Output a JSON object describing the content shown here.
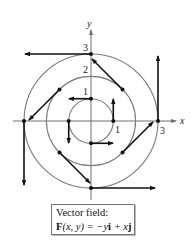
{
  "diagram": {
    "type": "vector_field_plot",
    "axes": {
      "x_label": "x",
      "y_label": "y"
    },
    "tick_labels": [
      {
        "text": "1",
        "position": "x=1 below axis"
      },
      {
        "text": "3",
        "position": "x=3 below axis"
      },
      {
        "text": "1",
        "position": "y=1 left of axis"
      },
      {
        "text": "2",
        "position": "y=2 left of axis"
      },
      {
        "text": "3",
        "position": "y=3 left of axis"
      }
    ],
    "circles": [
      {
        "radius": 1
      },
      {
        "radius": 2
      },
      {
        "radius": 3
      }
    ],
    "vectors": [
      {
        "point": [
          0,
          1
        ],
        "vector": [
          -1,
          0
        ]
      },
      {
        "point": [
          1,
          0
        ],
        "vector": [
          0,
          1
        ]
      },
      {
        "point": [
          -1,
          0
        ],
        "vector": [
          0,
          -1
        ]
      },
      {
        "point": [
          0,
          -1
        ],
        "vector": [
          1,
          0
        ]
      },
      {
        "point": [
          1.414,
          1.414
        ],
        "vector": [
          -1.414,
          1.414
        ]
      },
      {
        "point": [
          -1.414,
          1.414
        ],
        "vector": [
          -1.414,
          -1.414
        ]
      },
      {
        "point": [
          -1.414,
          -1.414
        ],
        "vector": [
          1.414,
          -1.414
        ]
      },
      {
        "point": [
          1.414,
          -1.414
        ],
        "vector": [
          1.414,
          1.414
        ]
      },
      {
        "point": [
          0,
          3
        ],
        "vector": [
          -3,
          0
        ]
      },
      {
        "point": [
          3,
          0
        ],
        "vector": [
          0,
          3
        ]
      },
      {
        "point": [
          -3,
          0
        ],
        "vector": [
          0,
          -3
        ]
      },
      {
        "point": [
          0,
          -3
        ],
        "vector": [
          3,
          0
        ]
      }
    ]
  },
  "labels": {
    "x_axis": "x",
    "y_axis": "y",
    "x_tick_1": "1",
    "x_tick_3": "3",
    "y_tick_1": "1",
    "y_tick_2": "2",
    "y_tick_3": "3"
  },
  "caption": {
    "line1": "Vector field:",
    "line2_F": "F",
    "line2_args": "(x, y) = −y",
    "line2_i": "i",
    "line2_plus": " + x",
    "line2_j": "j"
  }
}
